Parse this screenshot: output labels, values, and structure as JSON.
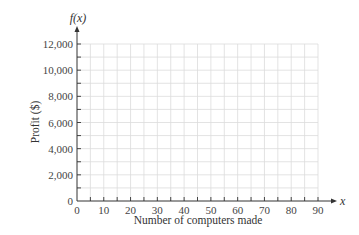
{
  "chart_data": {
    "type": "line",
    "title": "",
    "xlabel": "Number of computers made",
    "ylabel": "Profit ($)",
    "x_axis_symbol": "x",
    "y_axis_symbol": "f(x)",
    "xlim": [
      0,
      90
    ],
    "ylim": [
      0,
      12000
    ],
    "x_ticks": [
      0,
      10,
      20,
      30,
      40,
      50,
      60,
      70,
      80,
      90
    ],
    "x_tick_labels": [
      "0",
      "10",
      "20",
      "30",
      "40",
      "50",
      "60",
      "70",
      "80",
      "90"
    ],
    "y_ticks": [
      0,
      2000,
      4000,
      6000,
      8000,
      10000,
      12000
    ],
    "y_tick_labels": [
      "0",
      "2,000",
      "4,000",
      "6,000",
      "8,000",
      "10,000",
      "12,000"
    ],
    "x_minor_step": 5,
    "y_minor_step": 1000,
    "grid": true,
    "series": [],
    "colors": {
      "axis": "#333333",
      "grid": "#dcdcdc",
      "text": "#444444"
    }
  }
}
